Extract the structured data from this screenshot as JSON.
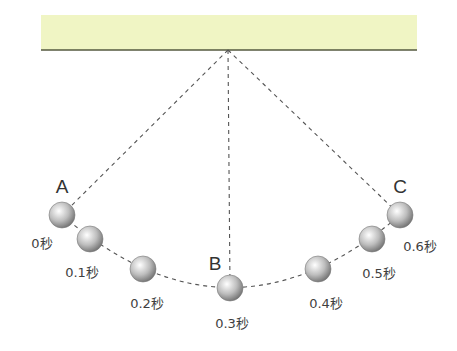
{
  "diagram": {
    "ceiling": {
      "x": 41,
      "y": 15,
      "width": 376,
      "height": 35,
      "fill": "#f0f5c4",
      "line_color": "#55583f"
    },
    "pivot": {
      "x": 228,
      "y": 50
    },
    "strings": [
      {
        "name": "string-to-A",
        "to": [
          62,
          215
        ]
      },
      {
        "name": "string-to-B",
        "to": [
          230,
          288
        ]
      },
      {
        "name": "string-to-C",
        "to": [
          400,
          215
        ]
      }
    ],
    "arc_path": "M62,215 Q230,360 400,215",
    "ball_radius": 13,
    "balls": [
      {
        "x": 62,
        "y": 215,
        "time": "0秒",
        "tx": 42,
        "ty": 242,
        "point": "A",
        "px": 62,
        "py": 187
      },
      {
        "x": 90,
        "y": 239,
        "time": "0.1秒",
        "tx": 82,
        "ty": 271
      },
      {
        "x": 143,
        "y": 269,
        "time": "0.2秒",
        "tx": 147,
        "ty": 302
      },
      {
        "x": 230,
        "y": 288,
        "time": "0.3秒",
        "tx": 232,
        "ty": 322,
        "point": "B",
        "px": 215,
        "py": 264
      },
      {
        "x": 318,
        "y": 269,
        "time": "0.4秒",
        "tx": 326,
        "ty": 302
      },
      {
        "x": 372,
        "y": 239,
        "time": "0.5秒",
        "tx": 379,
        "ty": 272
      },
      {
        "x": 400,
        "y": 215,
        "time": "0.6秒",
        "tx": 420,
        "ty": 245,
        "point": "C",
        "px": 400,
        "py": 187
      }
    ],
    "colors": {
      "dash": "#555555",
      "ball_light": "#ffffff",
      "ball_mid": "#bdbdbd",
      "ball_dark": "#6e6e6e"
    }
  }
}
